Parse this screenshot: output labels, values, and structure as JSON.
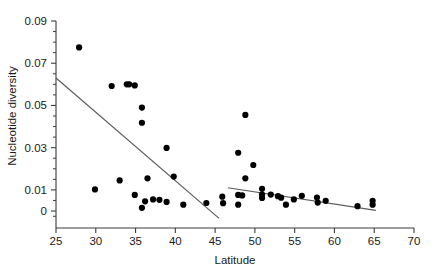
{
  "figure": {
    "kind": "scatter-plot",
    "background": "#ffffff",
    "point_color": "#000000",
    "line_color": "#5a5a5a",
    "axis_color": "#3c3c3c"
  },
  "chart_data": {
    "type": "scatter",
    "title": "",
    "xlabel": "Latitude",
    "ylabel": "Nucleotide diversity",
    "xlim": [
      25,
      70
    ],
    "ylim": [
      -0.0045,
      0.09
    ],
    "xticks": [
      25,
      30,
      35,
      40,
      45,
      50,
      55,
      60,
      65,
      70
    ],
    "xticklabels": [
      "25",
      "30",
      "35",
      "40",
      "45",
      "50",
      "55",
      "60",
      "65",
      "70"
    ],
    "yticks": [
      0,
      0.01,
      0.03,
      0.05,
      0.07,
      0.09
    ],
    "yticklabels": [
      "0",
      "0.01",
      "0.03",
      "0.05",
      "0.07",
      "0.09"
    ],
    "y_minor_tick_step": 0.005,
    "grid": false,
    "legend": null,
    "marker": "filled-circle",
    "marker_size_px": 6.2,
    "points": [
      {
        "x": 27.9,
        "y": 0.0775
      },
      {
        "x": 29.9,
        "y": 0.0102
      },
      {
        "x": 32.0,
        "y": 0.0592
      },
      {
        "x": 33.0,
        "y": 0.0145
      },
      {
        "x": 33.9,
        "y": 0.06
      },
      {
        "x": 34.2,
        "y": 0.06
      },
      {
        "x": 34.9,
        "y": 0.0595
      },
      {
        "x": 34.9,
        "y": 0.0076
      },
      {
        "x": 35.8,
        "y": 0.049
      },
      {
        "x": 35.8,
        "y": 0.0418
      },
      {
        "x": 35.8,
        "y": 0.0015
      },
      {
        "x": 36.2,
        "y": 0.0046
      },
      {
        "x": 36.5,
        "y": 0.0155
      },
      {
        "x": 37.2,
        "y": 0.0055
      },
      {
        "x": 38.0,
        "y": 0.0053
      },
      {
        "x": 38.9,
        "y": 0.0299
      },
      {
        "x": 38.9,
        "y": 0.0043
      },
      {
        "x": 39.8,
        "y": 0.0163
      },
      {
        "x": 41.0,
        "y": 0.003
      },
      {
        "x": 43.9,
        "y": 0.0038
      },
      {
        "x": 45.9,
        "y": 0.0068
      },
      {
        "x": 46.0,
        "y": 0.0037
      },
      {
        "x": 47.9,
        "y": 0.0276
      },
      {
        "x": 47.9,
        "y": 0.0076
      },
      {
        "x": 47.9,
        "y": 0.003
      },
      {
        "x": 48.4,
        "y": 0.0074
      },
      {
        "x": 48.8,
        "y": 0.0455
      },
      {
        "x": 48.8,
        "y": 0.0155
      },
      {
        "x": 49.8,
        "y": 0.0218
      },
      {
        "x": 50.9,
        "y": 0.0105
      },
      {
        "x": 50.9,
        "y": 0.0078
      },
      {
        "x": 50.9,
        "y": 0.0062
      },
      {
        "x": 52.0,
        "y": 0.0078
      },
      {
        "x": 52.9,
        "y": 0.007
      },
      {
        "x": 53.3,
        "y": 0.0063
      },
      {
        "x": 53.9,
        "y": 0.003
      },
      {
        "x": 54.9,
        "y": 0.0055
      },
      {
        "x": 55.9,
        "y": 0.0072
      },
      {
        "x": 57.8,
        "y": 0.0064
      },
      {
        "x": 57.9,
        "y": 0.004
      },
      {
        "x": 58.9,
        "y": 0.0048
      },
      {
        "x": 62.9,
        "y": 0.0023
      },
      {
        "x": 64.8,
        "y": 0.0048
      },
      {
        "x": 64.8,
        "y": 0.003
      }
    ],
    "trend_lines": [
      {
        "name": "southern-trend",
        "x_start": 25.0,
        "y_start": 0.063,
        "x_end": 45.5,
        "y_end": -0.0035
      },
      {
        "name": "northern-trend",
        "x_start": 46.6,
        "y_start": 0.011,
        "x_end": 65.2,
        "y_end": 0.0003
      }
    ]
  }
}
